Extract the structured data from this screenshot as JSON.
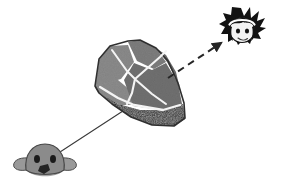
{
  "scene": {
    "title": "Line-of-sight diagram: creature sees rock, reflected view to character",
    "background_color": "#ffffff",
    "width": 282,
    "height": 185
  },
  "objects": {
    "rock": {
      "name": "rock",
      "label": "gray boulder",
      "body_color": "#7c7c7c",
      "left_face_color": "#8a8a8a",
      "right_face_color": "#6e6e6e",
      "top_face_color": "#848484",
      "crack_color": "#f2f2f2",
      "shadow_color": "#1a1a1a",
      "outline_color": "#3a3a3a"
    },
    "creature": {
      "name": "creature",
      "label": "small gray creature head",
      "head_color": "#8d8d8d",
      "ear_color": "#9a9a9a",
      "eye_color": "#1c1c1c",
      "snout_color": "#2a2a2a",
      "outline_color": "#4a4a4a"
    },
    "character": {
      "name": "character-head",
      "label": "spiky haired character head",
      "hair_color": "#111111",
      "face_color": "#f4f4f4",
      "headband_color": "#ffffff",
      "eye_color": "#111111",
      "outline_color": "#111111"
    }
  },
  "connectors": {
    "sight_line": {
      "name": "sight-line",
      "label": "solid sight line from creature to rock",
      "style": "solid",
      "color": "#333333",
      "width": 1,
      "from": [
        60,
        152
      ],
      "to": [
        124,
        110
      ]
    },
    "reflection_arrow": {
      "name": "reflection-arrow",
      "label": "dashed arrow from rock to character",
      "style": "dashed",
      "dash_pattern": "7 5",
      "color": "#262626",
      "width": 2,
      "from": [
        168,
        76
      ],
      "to": [
        224,
        42
      ],
      "arrowhead": true
    }
  }
}
